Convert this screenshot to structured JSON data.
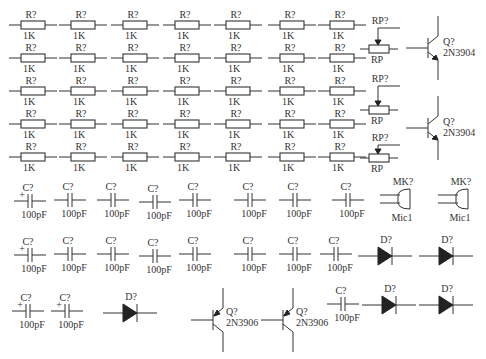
{
  "resistors": {
    "designator": "R?",
    "value": "1K",
    "columns_x": [
      33,
      83,
      135,
      187,
      238,
      292,
      342
    ],
    "rows_y": [
      25,
      58,
      91,
      124,
      157
    ]
  },
  "potentiometers": [
    {
      "designator": "RP?",
      "value": "RP",
      "x": 378,
      "y": 49,
      "label_y": 20
    },
    {
      "designator": "RP?",
      "value": "RP",
      "x": 378,
      "y": 110,
      "label_y": 78
    },
    {
      "designator": "RP?",
      "value": "RP",
      "x": 378,
      "y": 158,
      "label_y": 137
    }
  ],
  "transistors_npn": [
    {
      "designator": "Q?",
      "part": "2N3904",
      "x": 428,
      "y": 48
    },
    {
      "designator": "Q?",
      "part": "2N3904",
      "x": 428,
      "y": 128
    }
  ],
  "transistors_pnp": [
    {
      "designator": "Q?",
      "part": "2N3906",
      "x": 213,
      "y": 320
    },
    {
      "designator": "Q?",
      "part": "2N3906",
      "x": 283,
      "y": 320
    }
  ],
  "capacitors": {
    "designator": "C?",
    "value": "100pF",
    "row1": [
      {
        "x": 30,
        "y": 201,
        "polarized": true
      },
      {
        "x": 70,
        "y": 200,
        "polarized": false
      },
      {
        "x": 113,
        "y": 200,
        "polarized": false
      },
      {
        "x": 155,
        "y": 202,
        "polarized": false
      },
      {
        "x": 195,
        "y": 200,
        "polarized": false
      },
      {
        "x": 250,
        "y": 200,
        "polarized": false
      },
      {
        "x": 295,
        "y": 200,
        "polarized": false
      },
      {
        "x": 348,
        "y": 200,
        "polarized": false
      }
    ],
    "row2": [
      {
        "x": 30,
        "y": 255,
        "polarized": true
      },
      {
        "x": 70,
        "y": 254,
        "polarized": false
      },
      {
        "x": 113,
        "y": 254,
        "polarized": false
      },
      {
        "x": 155,
        "y": 256,
        "polarized": false
      },
      {
        "x": 195,
        "y": 254,
        "polarized": false
      },
      {
        "x": 250,
        "y": 254,
        "polarized": false
      },
      {
        "x": 295,
        "y": 254,
        "polarized": false
      },
      {
        "x": 336,
        "y": 254,
        "polarized": false
      }
    ],
    "row3": [
      {
        "x": 28,
        "y": 311,
        "polarized": true
      },
      {
        "x": 67,
        "y": 311,
        "polarized": true
      },
      {
        "x": 343,
        "y": 304,
        "polarized": false
      }
    ]
  },
  "microphones": [
    {
      "designator": "MK?",
      "part": "Mic1",
      "x": 405,
      "y": 199
    },
    {
      "designator": "MK?",
      "part": "Mic1",
      "x": 463,
      "y": 199
    }
  ],
  "diodes": {
    "designator": "D?",
    "items": [
      {
        "x": 386,
        "y": 256
      },
      {
        "x": 447,
        "y": 256
      },
      {
        "x": 131,
        "y": 313
      },
      {
        "x": 390,
        "y": 305
      },
      {
        "x": 447,
        "y": 305
      }
    ]
  }
}
